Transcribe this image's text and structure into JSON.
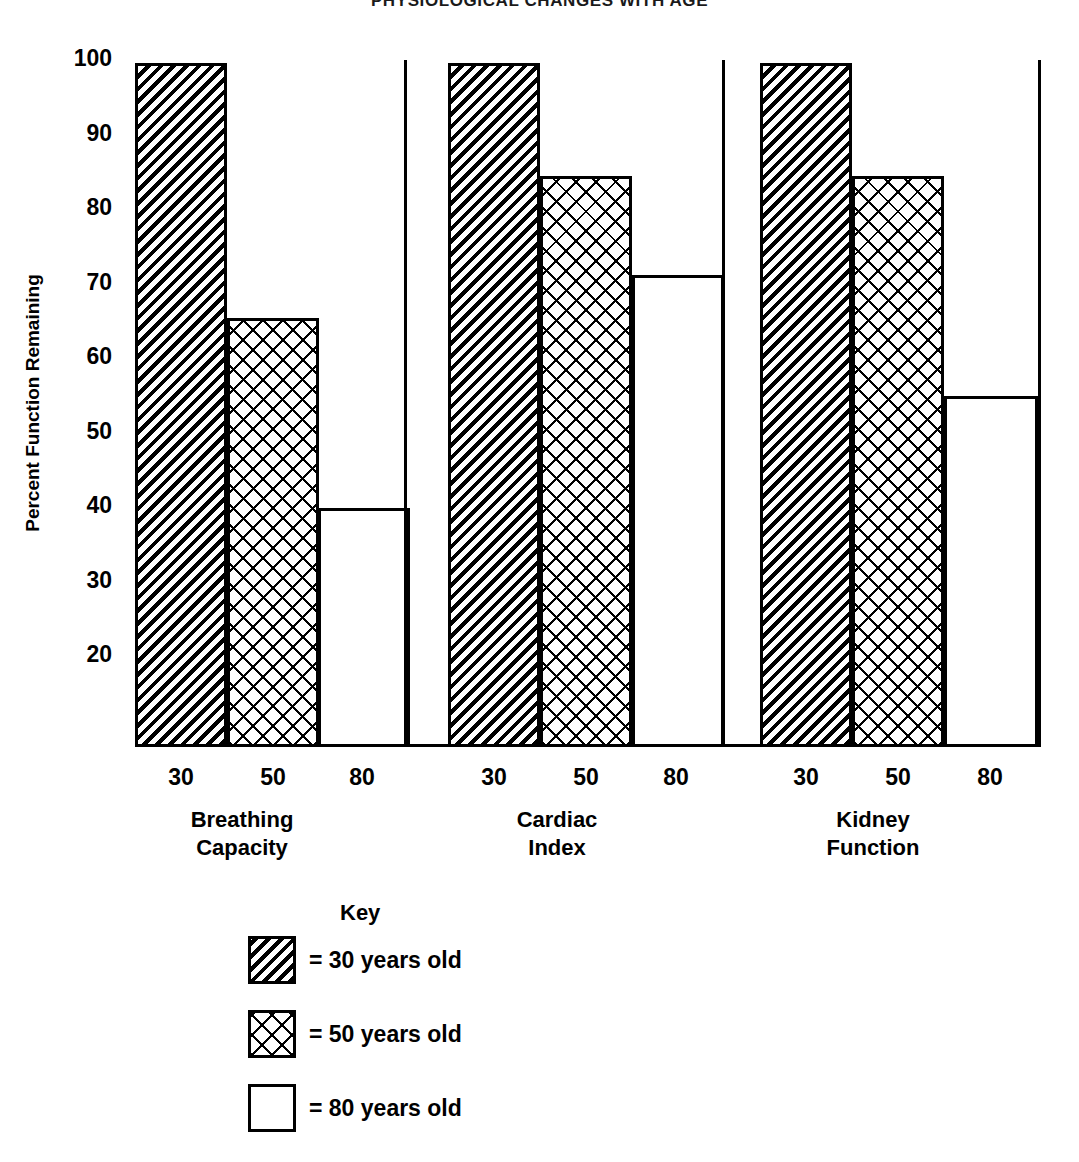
{
  "chart_data": {
    "type": "bar",
    "title": "PHYSIOLOGICAL CHANGES WITH AGE",
    "xlabel": "",
    "ylabel": "Percent Function Remaining",
    "ylim": [
      8,
      104
    ],
    "yticks": [
      100,
      90,
      80,
      70,
      60,
      50,
      40,
      30,
      20
    ],
    "grid": false,
    "legend_position": "below-plot-left",
    "categories": [
      "Breathing Capacity",
      "Cardiac Index",
      "Kidney Function"
    ],
    "series": [
      {
        "name": "30 years old",
        "pattern": "diagonal-hatch",
        "values": [
          100,
          100,
          100
        ]
      },
      {
        "name": "50 years old",
        "pattern": "cross-hatch",
        "values": [
          66,
          85,
          85
        ]
      },
      {
        "name": "80 years old",
        "pattern": "white-blank",
        "values": [
          41,
          71.5,
          56
        ]
      }
    ],
    "x_tick_labels": [
      "30",
      "50",
      "80",
      "30",
      "50",
      "80",
      "30",
      "50",
      "80"
    ]
  },
  "axis": {
    "y_title": "Percent Function Remaining",
    "y_ticks": [
      {
        "label": "100",
        "top": 47
      },
      {
        "label": "90",
        "top": 122
      },
      {
        "label": "80",
        "top": 196
      },
      {
        "label": "70",
        "top": 271
      },
      {
        "label": "60",
        "top": 345
      },
      {
        "label": "50",
        "top": 420
      },
      {
        "label": "40",
        "top": 494
      },
      {
        "label": "30",
        "top": 569
      },
      {
        "label": "20",
        "top": 643
      }
    ]
  },
  "groups": [
    {
      "name": "Breathing Capacity",
      "label_line1": "Breathing",
      "label_line2": "Capacity",
      "label_left": 122,
      "divider_left": 404,
      "bars": [
        {
          "age": "30",
          "value": 100,
          "pattern": "hatch",
          "left": 135,
          "width": 92,
          "height": 684,
          "tick_left": 135
        },
        {
          "age": "50",
          "value": 66,
          "pattern": "cross",
          "left": 227,
          "width": 92,
          "height": 429,
          "tick_left": 227
        },
        {
          "age": "80",
          "value": 41,
          "pattern": "plain",
          "left": 318,
          "width": 92,
          "height": 239,
          "tick_left": 316
        }
      ]
    },
    {
      "name": "Cardiac Index",
      "label_line1": "Cardiac",
      "label_line2": "Index",
      "label_left": 437,
      "divider_left": 722,
      "bars": [
        {
          "age": "30",
          "value": 100,
          "pattern": "hatch",
          "left": 448,
          "width": 92,
          "height": 684,
          "tick_left": 448
        },
        {
          "age": "50",
          "value": 85,
          "pattern": "cross",
          "left": 540,
          "width": 92,
          "height": 571,
          "tick_left": 540
        },
        {
          "age": "80",
          "value": 71.5,
          "pattern": "plain",
          "left": 632,
          "width": 92,
          "height": 472,
          "tick_left": 630
        }
      ]
    },
    {
      "name": "Kidney Function",
      "label_line1": "Kidney",
      "label_line2": "Function",
      "label_left": 753,
      "divider_left": 1038,
      "bars": [
        {
          "age": "30",
          "value": 100,
          "pattern": "hatch",
          "left": 760,
          "width": 92,
          "height": 684,
          "tick_left": 760
        },
        {
          "age": "50",
          "value": 85,
          "pattern": "cross",
          "left": 852,
          "width": 92,
          "height": 571,
          "tick_left": 852
        },
        {
          "age": "80",
          "value": 56,
          "pattern": "plain",
          "left": 944,
          "width": 94,
          "height": 351,
          "tick_left": 944
        }
      ]
    }
  ],
  "legend": {
    "title": "Key",
    "items": [
      {
        "pattern": "hatch",
        "text": "= 30 years old",
        "top": 36
      },
      {
        "pattern": "cross",
        "text": "= 50 years old",
        "top": 110
      },
      {
        "pattern": "plain",
        "text": "= 80 years old",
        "top": 184
      }
    ]
  }
}
